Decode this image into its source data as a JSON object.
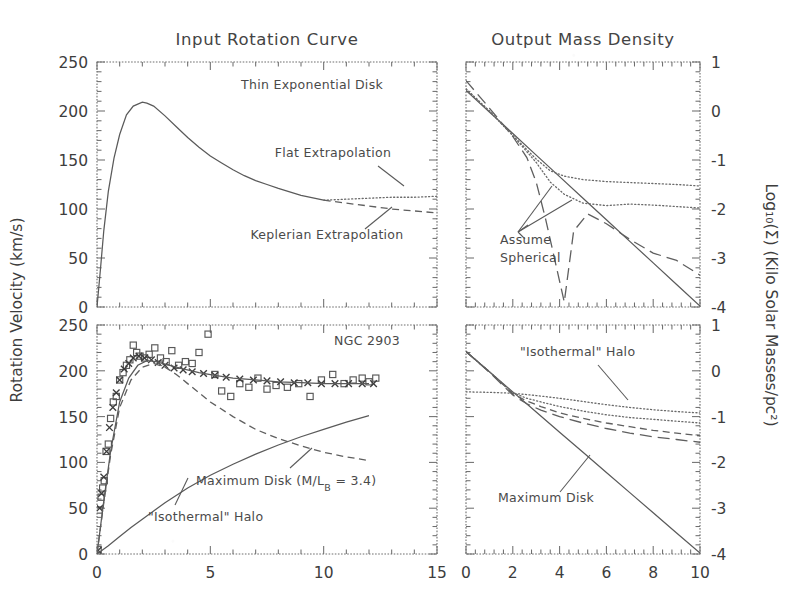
{
  "figure": {
    "panels": {
      "top_left_title": "Input Rotation Curve",
      "top_right_title": "Output Mass Density"
    },
    "axis_labels": {
      "left": "Rotation Velocity (km/s)",
      "right": "Log₁₀(Σ) (Kilo Solar Masses/pc²)"
    },
    "annotations": {
      "thin_exponential_disk": "Thin Exponential Disk",
      "flat_extrapolation": "Flat Extrapolation",
      "keplerian_extrapolation": "Keplerian Extrapolation",
      "assume_spherical_line1": "Assume",
      "assume_spherical_line2": "Spherical",
      "galaxy_name": "NGC 2903",
      "maximum_disk_ml": "Maximum Disk (M/L",
      "maximum_disk_sub": "B",
      "maximum_disk_val": " = 3.4)",
      "isothermal_halo": "\"Isothermal\" Halo",
      "isothermal_halo_br": "\"Isothermal\" Halo",
      "maximum_disk_br": "Maximum Disk"
    }
  },
  "chart_data": [
    {
      "id": "top-left",
      "type": "line",
      "title": "Input Rotation Curve",
      "xlabel": "",
      "ylabel": "Rotation Velocity (km/s)",
      "xlim": [
        0,
        15
      ],
      "ylim": [
        0,
        250
      ],
      "xticks": [
        0,
        5,
        10,
        15
      ],
      "xticklabels": [
        "",
        "",
        "",
        ""
      ],
      "yticks": [
        0,
        50,
        100,
        150,
        200,
        250
      ],
      "yticklabels": [
        "0",
        "50",
        "100",
        "150",
        "200",
        "250"
      ],
      "grid": false,
      "series": [
        {
          "name": "Thin Exponential Disk",
          "style": "solid",
          "x": [
            0,
            0.15,
            0.3,
            0.5,
            0.75,
            1.0,
            1.3,
            1.6,
            2.0,
            2.2,
            2.5,
            3.0,
            3.5,
            4.0,
            4.5,
            5.0,
            5.5,
            6.0,
            6.5,
            7.0,
            7.5,
            8.0,
            9.0,
            10.0
          ],
          "y": [
            0,
            38,
            78,
            118,
            152,
            176,
            196,
            205,
            209,
            208,
            205,
            195,
            184,
            173,
            163,
            154,
            147,
            140,
            134,
            129,
            125,
            121,
            114,
            109
          ]
        },
        {
          "name": "Flat Extrapolation",
          "style": "dotted",
          "x": [
            10.0,
            11.0,
            12.0,
            13.0,
            14.0,
            15.0
          ],
          "y": [
            109,
            110,
            111,
            112,
            112,
            113
          ]
        },
        {
          "name": "Keplerian Extrapolation",
          "style": "dashed",
          "x": [
            10.0,
            11.0,
            12.0,
            13.0,
            14.0,
            15.0
          ],
          "y": [
            109,
            106,
            103,
            100,
            98,
            96
          ]
        }
      ]
    },
    {
      "id": "top-right",
      "type": "line",
      "title": "Output Mass Density",
      "xlabel": "",
      "ylabel": "Log₁₀(Σ) (Kilo Solar Masses/pc²)",
      "xlim": [
        0,
        10
      ],
      "ylim": [
        -4,
        1
      ],
      "xticks": [
        0,
        2,
        4,
        6,
        8,
        10
      ],
      "xticklabels": [
        "",
        "",
        "",
        "",
        "",
        ""
      ],
      "yticks": [
        -4,
        -3,
        -2,
        -1,
        0,
        1
      ],
      "yticklabels": [
        "-4",
        "-3",
        "-2",
        "-1",
        "0",
        "1"
      ],
      "grid": false,
      "series": [
        {
          "name": "Maximum Disk (solid)",
          "style": "solid",
          "x": [
            0,
            1,
            2,
            3,
            4,
            5,
            6,
            7,
            8,
            9,
            10
          ],
          "y": [
            0.42,
            -0.02,
            -0.46,
            -0.9,
            -1.34,
            -1.78,
            -2.22,
            -2.66,
            -3.1,
            -3.54,
            -3.98
          ]
        },
        {
          "name": "Assume Spherical (long dash)",
          "style": "longdash",
          "x": [
            0,
            1,
            2,
            2.6,
            3.0,
            3.4,
            3.8,
            4.2,
            4.6,
            5.2,
            6.0,
            7.0,
            8.0,
            9.0,
            10.0
          ],
          "y": [
            0.62,
            0.06,
            -0.52,
            -0.95,
            -1.45,
            -2.2,
            -3.05,
            -3.9,
            -2.45,
            -2.1,
            -2.3,
            -2.62,
            -2.9,
            -3.05,
            -3.35
          ]
        },
        {
          "name": "Flat extrapolation density (dotted upper)",
          "style": "dotted",
          "x": [
            0,
            1,
            2,
            3,
            3.6,
            4.2,
            5,
            6,
            7,
            8,
            9,
            10
          ],
          "y": [
            0.45,
            0.0,
            -0.5,
            -0.98,
            -1.22,
            -1.33,
            -1.4,
            -1.44,
            -1.46,
            -1.48,
            -1.5,
            -1.53
          ]
        },
        {
          "name": "Keplerian extrapolation density (dotted lower)",
          "style": "dotted",
          "x": [
            0,
            1,
            2,
            3,
            3.6,
            4.2,
            5,
            6,
            7,
            8,
            9,
            10
          ],
          "y": [
            0.45,
            0.0,
            -0.5,
            -1.05,
            -1.45,
            -1.7,
            -1.88,
            -1.93,
            -1.9,
            -1.92,
            -1.95,
            -1.98
          ]
        }
      ]
    },
    {
      "id": "bottom-left",
      "type": "scatter+line",
      "title": "NGC 2903",
      "xlabel": "",
      "ylabel": "Rotation Velocity (km/s)",
      "xlim": [
        0,
        15
      ],
      "ylim": [
        0,
        250
      ],
      "xticks": [
        0,
        5,
        10,
        15
      ],
      "xticklabels": [
        "0",
        "5",
        "10",
        "15"
      ],
      "yticks": [
        0,
        50,
        100,
        150,
        200,
        250
      ],
      "yticklabels": [
        "0",
        "50",
        "100",
        "150",
        "200",
        "250"
      ],
      "grid": false,
      "series": [
        {
          "name": "Observed rotation curve (squares)",
          "style": "squares",
          "x": [
            0.05,
            0.1,
            0.18,
            0.25,
            0.32,
            0.4,
            0.5,
            0.6,
            0.72,
            0.85,
            1.0,
            1.15,
            1.3,
            1.45,
            1.6,
            1.75,
            1.9,
            2.1,
            2.3,
            2.55,
            2.8,
            3.05,
            3.3,
            3.6,
            3.9,
            4.2,
            4.5,
            4.9,
            5.2,
            5.5,
            5.9,
            6.3,
            6.7,
            7.1,
            7.5,
            7.9,
            8.4,
            8.9,
            9.4,
            9.9,
            10.4,
            10.9,
            11.3,
            11.7,
            12.0,
            12.3
          ],
          "y": [
            5,
            48,
            62,
            72,
            80,
            112,
            120,
            148,
            166,
            172,
            190,
            198,
            206,
            212,
            228,
            220,
            216,
            214,
            218,
            225,
            214,
            210,
            222,
            206,
            210,
            208,
            220,
            240,
            196,
            178,
            172,
            186,
            182,
            192,
            180,
            184,
            182,
            186,
            172,
            190,
            196,
            186,
            190,
            192,
            188,
            192
          ]
        },
        {
          "name": "Model fit (crosses)",
          "style": "crosses",
          "x": [
            0.05,
            0.12,
            0.2,
            0.3,
            0.42,
            0.55,
            0.7,
            0.85,
            1.0,
            1.2,
            1.4,
            1.6,
            1.85,
            2.1,
            2.4,
            2.7,
            3.0,
            3.4,
            3.8,
            4.2,
            4.7,
            5.2,
            5.7,
            6.3,
            6.9,
            7.5,
            8.1,
            8.7,
            9.3,
            9.9,
            10.5,
            11.1,
            11.7,
            12.2
          ],
          "y": [
            4,
            50,
            66,
            84,
            112,
            138,
            160,
            176,
            190,
            202,
            208,
            214,
            216,
            214,
            212,
            209,
            206,
            203,
            201,
            199,
            197,
            195,
            193,
            191,
            190,
            189,
            188,
            187,
            187,
            186,
            186,
            186,
            186,
            186
          ]
        },
        {
          "name": "Total model (solid)",
          "style": "solid-thin",
          "x": [
            0,
            0.3,
            0.6,
            1.0,
            1.4,
            1.8,
            2.2,
            2.6,
            3.2,
            3.8,
            4.5,
            5.2,
            6.0,
            7.0,
            8.0,
            9.0,
            10.0,
            11.0,
            12.0
          ],
          "y": [
            0,
            58,
            112,
            166,
            192,
            206,
            211,
            210,
            206,
            202,
            198,
            195,
            192,
            190,
            188,
            187,
            186,
            186,
            186
          ]
        },
        {
          "name": "Maximum Disk",
          "style": "dashed-thin",
          "x": [
            0,
            0.3,
            0.6,
            1.0,
            1.5,
            2.0,
            2.5,
            3.0,
            3.5,
            4.0,
            5.0,
            6.0,
            7.0,
            8.0,
            9.0,
            10.0,
            11.0,
            12.0
          ],
          "y": [
            0,
            56,
            108,
            160,
            190,
            204,
            208,
            204,
            196,
            186,
            166,
            150,
            136,
            126,
            118,
            111,
            106,
            102
          ]
        },
        {
          "name": "\"Isothermal\" Halo",
          "style": "solid-thin",
          "x": [
            0,
            0.5,
            1.0,
            1.5,
            2.0,
            3.0,
            4.0,
            5.0,
            6.0,
            7.0,
            8.0,
            9.0,
            10.0,
            11.0,
            12.0
          ],
          "y": [
            0,
            9,
            19,
            29,
            38,
            56,
            72,
            86,
            98,
            109,
            119,
            128,
            136,
            144,
            151
          ]
        }
      ]
    },
    {
      "id": "bottom-right",
      "type": "line",
      "title": "",
      "xlabel": "",
      "ylabel": "Log₁₀(Σ) (Kilo Solar Masses/pc²)",
      "xlim": [
        0,
        10
      ],
      "ylim": [
        -4,
        1
      ],
      "xticks": [
        0,
        2,
        4,
        6,
        8,
        10
      ],
      "xticklabels": [
        "0",
        "2",
        "4",
        "6",
        "8",
        "10"
      ],
      "yticks": [
        -4,
        -3,
        -2,
        -1,
        0,
        1
      ],
      "yticklabels": [
        "-4",
        "-3",
        "-2",
        "-1",
        "0",
        "1"
      ],
      "grid": false,
      "series": [
        {
          "name": "Maximum Disk",
          "style": "solid",
          "x": [
            0,
            1,
            2,
            3,
            4,
            5,
            6,
            7,
            8,
            9,
            10
          ],
          "y": [
            0.42,
            -0.02,
            -0.46,
            -0.9,
            -1.34,
            -1.78,
            -2.22,
            -2.66,
            -3.1,
            -3.54,
            -3.98
          ]
        },
        {
          "name": "\"Isothermal\" Halo",
          "style": "dotted",
          "x": [
            0,
            1,
            2,
            3,
            4,
            5,
            6,
            7,
            8,
            9,
            10
          ],
          "y": [
            -0.46,
            -0.47,
            -0.49,
            -0.54,
            -0.6,
            -0.67,
            -0.74,
            -0.8,
            -0.85,
            -0.89,
            -0.92
          ]
        },
        {
          "name": "Halo variant dotted",
          "style": "dotted",
          "x": [
            0,
            1,
            2,
            2.6,
            3.2,
            4,
            5,
            6,
            7,
            8,
            9,
            10
          ],
          "y": [
            0.42,
            -0.02,
            -0.48,
            -0.6,
            -0.68,
            -0.78,
            -0.88,
            -0.96,
            -1.02,
            -1.06,
            -1.1,
            -1.14
          ]
        },
        {
          "name": "Halo variant dashed",
          "style": "dashed",
          "x": [
            0,
            1,
            2,
            2.6,
            3.2,
            4,
            5,
            6,
            7,
            8,
            9,
            10
          ],
          "y": [
            0.42,
            -0.02,
            -0.5,
            -0.66,
            -0.78,
            -0.92,
            -1.04,
            -1.14,
            -1.22,
            -1.3,
            -1.36,
            -1.42
          ]
        },
        {
          "name": "Halo variant long dash",
          "style": "longdash",
          "x": [
            0,
            1,
            2,
            2.6,
            3.2,
            4,
            5,
            6,
            7,
            8,
            9,
            10
          ],
          "y": [
            0.42,
            -0.03,
            -0.53,
            -0.72,
            -0.86,
            -1.0,
            -1.14,
            -1.26,
            -1.36,
            -1.44,
            -1.5,
            -1.56
          ]
        }
      ]
    }
  ]
}
